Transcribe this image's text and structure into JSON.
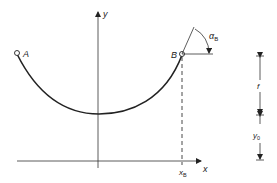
{
  "diagram": {
    "type": "catenary-cable-geometry",
    "axes": {
      "x_label": "x",
      "y_label": "y"
    },
    "points": {
      "A": "A",
      "B": "B"
    },
    "angle": {
      "symbol": "α",
      "subscript": "B"
    },
    "x_marker": {
      "symbol": "x",
      "subscript": "B"
    },
    "dimensions": {
      "sag": "f",
      "offset": {
        "symbol": "y",
        "subscript": "0"
      }
    },
    "colors": {
      "stroke": "#222222",
      "background": "#ffffff"
    }
  }
}
